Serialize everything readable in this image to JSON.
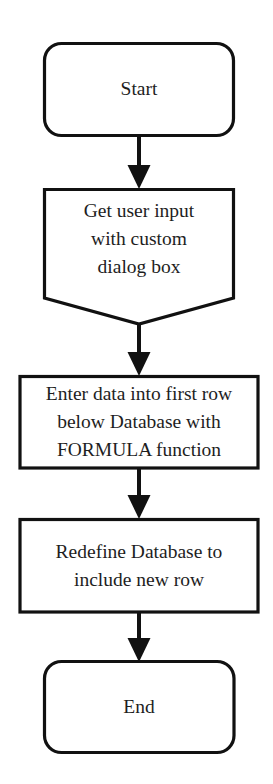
{
  "diagram": {
    "type": "flowchart",
    "direction": "top-to-bottom",
    "stroke_color": "#111111",
    "fill_color": "#ffffff",
    "text_color": "#1e1e1e",
    "nodes": [
      {
        "id": "start",
        "shape": "terminator",
        "lines": [
          "Start"
        ]
      },
      {
        "id": "input",
        "shape": "input-pentagon",
        "lines": [
          "Get user input",
          "with custom",
          "dialog box"
        ]
      },
      {
        "id": "enter-data",
        "shape": "process",
        "lines": [
          "Enter data into first row",
          "below Database with",
          "FORMULA function"
        ]
      },
      {
        "id": "redefine",
        "shape": "process",
        "lines": [
          "Redefine Database to",
          "include new row"
        ]
      },
      {
        "id": "end",
        "shape": "terminator",
        "lines": [
          "End"
        ]
      }
    ],
    "edges": [
      {
        "from": "start",
        "to": "input"
      },
      {
        "from": "input",
        "to": "enter-data"
      },
      {
        "from": "enter-data",
        "to": "redefine"
      },
      {
        "from": "redefine",
        "to": "end"
      }
    ]
  }
}
